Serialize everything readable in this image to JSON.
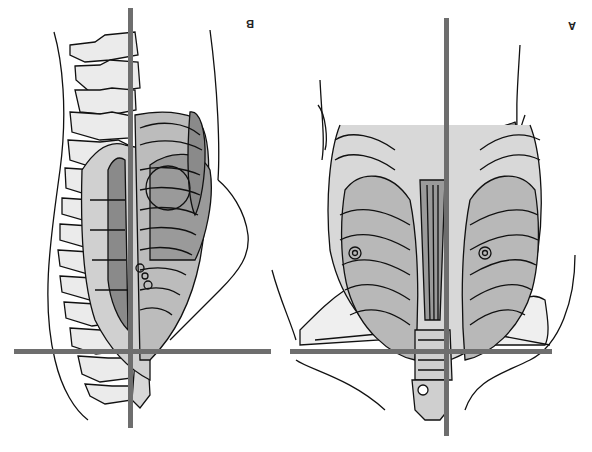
{
  "figure": {
    "orientation": "rotated 180 degrees",
    "panels": [
      {
        "id": "A",
        "label": "A",
        "description": "Anterior view of thoracic cage, lungs, liver and shoulders with crosshair reference lines"
      },
      {
        "id": "B",
        "label": "B",
        "description": "Lateral view of spine, ribcage and lungs with crosshair reference lines"
      }
    ],
    "colors": {
      "line": "#111111",
      "crosshair": "#6e6e6e",
      "shade_dark": "#8a8a8a",
      "shade_mid": "#b5b5b5",
      "shade_light": "#e2e2e2",
      "background": "#ffffff"
    }
  }
}
